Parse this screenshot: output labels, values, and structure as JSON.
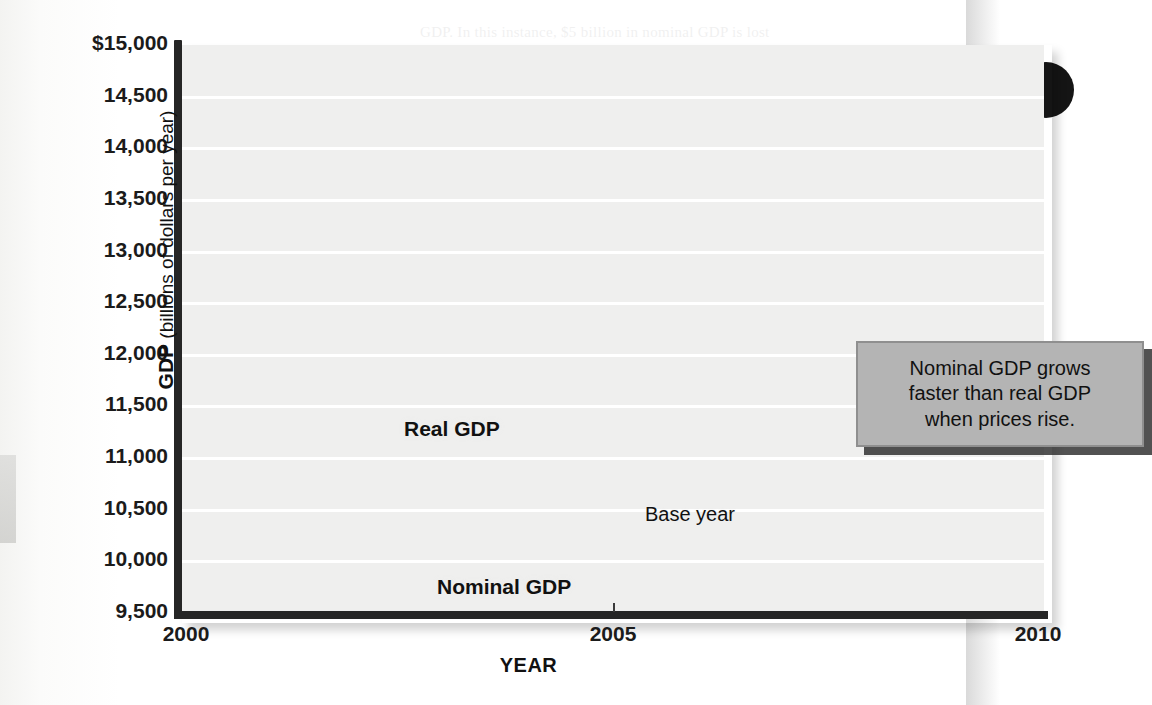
{
  "chart_data": {
    "type": "line",
    "title": "",
    "xlabel": "YEAR",
    "ylabel": "GDP (billions of dollars per year)",
    "ylabel_bold": "GDP",
    "ylabel_rest": " (billions of dollars per year)",
    "x": [
      2000,
      2001,
      2002,
      2003,
      2004,
      2005,
      2006,
      2007,
      2008,
      2009,
      2010
    ],
    "xlim": [
      2000,
      2010
    ],
    "ylim": [
      9500,
      15000
    ],
    "y_ticks": [
      9500,
      10000,
      10500,
      11000,
      11500,
      12000,
      12500,
      13000,
      13500,
      14000,
      14500,
      15000
    ],
    "y_tick_labels": [
      "9,500",
      "10,000",
      "10,500",
      "11,000",
      "11,500",
      "12,000",
      "12,500",
      "13,000",
      "13,500",
      "14,000",
      "14,500",
      "$15,000"
    ],
    "x_ticks": [
      2000,
      2005,
      2010
    ],
    "x_tick_labels": [
      "2000",
      "2005",
      "2010"
    ],
    "grid": true,
    "legend_position": "inline-labels",
    "series": [
      {
        "name": "Real GDP",
        "color": "#2b2b2b",
        "values": [
          11250,
          11380,
          11520,
          11830,
          12250,
          12650,
          12980,
          13250,
          13250,
          12900,
          13280
        ]
      },
      {
        "name": "Nominal GDP",
        "color": "#9a9a9a",
        "values": [
          9950,
          10250,
          10600,
          11000,
          11700,
          12650,
          13450,
          14100,
          14400,
          14150,
          14700
        ]
      }
    ],
    "fill_between": {
      "color": "#a8a8a8",
      "description": "shaded area between Real GDP and Nominal GDP"
    },
    "annotations": [
      {
        "name": "base-year",
        "label": "Base year",
        "x": 2005,
        "style": "vertical dashed line"
      },
      {
        "name": "callout",
        "text": "Nominal GDP grows faster than real GDP when prices rise.",
        "line1": "Nominal GDP grows",
        "line2": "faster than real GDP",
        "line3": "when prices rise."
      }
    ]
  },
  "colors": {
    "plot_background": "#efefee",
    "gridline": "#ffffff",
    "axis": "#262626",
    "real_gdp": "#2b2b2b",
    "nominal_gdp": "#9a9a9a",
    "band_fill": "#a8a8a8",
    "callout_fill": "#b4b4b4",
    "callout_border": "#8f8f8f"
  },
  "ghost_text": {
    "lines": [
      "GDP. In this instance, $5 billion in nominal GDP is lost",
      "GDP, while the quantity of goods and services actually",
      "produced. We can measure real GDP by estimating",
      "Real GDP is the value of final output produced in a given period,",
      "adjusted for changing prices. Let us see how the measure",
      "is done by using the base-year prices as a benchmark.",
      "A hypothetical example",
      "Nominal GDP rises in two ways",
      "base-year prices",
      "the value of final output in year",
      "To compute real GDP in this case, we adjust the nominal",
      "especially when the output of goods and services is measured"
    ]
  }
}
